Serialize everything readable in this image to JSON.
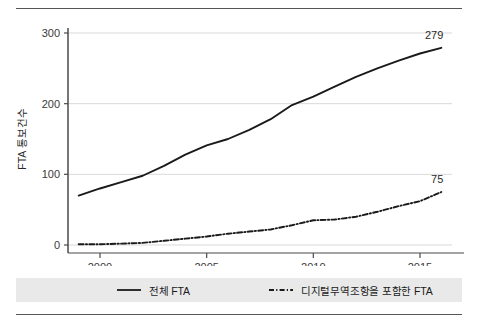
{
  "chart_data": {
    "type": "line",
    "title": "",
    "xlabel": "",
    "ylabel": "FTA 통보건수",
    "xlim": [
      1998.5,
      2016.5
    ],
    "ylim": [
      0,
      300
    ],
    "grid": true,
    "gridlines_y": [
      0,
      100,
      200,
      300
    ],
    "legend_position": "bottom",
    "x": [
      1999,
      2000,
      2001,
      2002,
      2003,
      2004,
      2005,
      2006,
      2007,
      2008,
      2009,
      2010,
      2011,
      2012,
      2013,
      2014,
      2015,
      2016
    ],
    "series": [
      {
        "name": "전체 FTA",
        "style": "solid",
        "color": "#1a1a1a",
        "values": [
          70,
          80,
          89,
          98,
          112,
          128,
          141,
          150,
          163,
          178,
          198,
          210,
          224,
          238,
          250,
          261,
          271,
          279
        ],
        "end_label": "279"
      },
      {
        "name": "디지털무역조항을 포함한 FTA",
        "style": "dash-dot",
        "color": "#1a1a1a",
        "values": [
          1,
          1,
          2,
          3,
          6,
          9,
          12,
          16,
          19,
          22,
          28,
          35,
          36,
          40,
          47,
          55,
          62,
          75
        ],
        "end_label": "75"
      }
    ],
    "x_ticks": [
      2000,
      2005,
      2010,
      2015
    ],
    "x_tick_labels": [
      "2000",
      "2005",
      "2010",
      "2015"
    ],
    "y_ticks": [
      0,
      100,
      200,
      300
    ],
    "y_tick_labels": [
      "0",
      "100",
      "200",
      "300"
    ],
    "annotations": [
      {
        "text": "279",
        "series": "전체 FTA",
        "at_x": 2016
      },
      {
        "text": "75",
        "series": "디지털무역조항을 포함한 FTA",
        "at_x": 2016
      }
    ]
  },
  "legend": {
    "items": [
      {
        "label": "전체 FTA",
        "style": "solid"
      },
      {
        "label": "디지털무역조항을 포함한 FTA",
        "style": "dash-dot"
      }
    ]
  }
}
